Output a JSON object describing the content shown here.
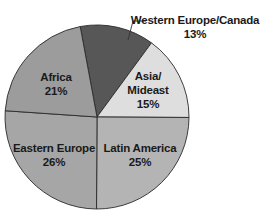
{
  "chart_data": {
    "type": "pie",
    "title": "",
    "start_angle_deg": -100.5,
    "direction": "clockwise",
    "center": [
      97,
      117
    ],
    "radius": 92,
    "slices": [
      {
        "label": "Western Europe/Canada",
        "value": 13,
        "display": "13%",
        "color": "#575757",
        "label_lines": [
          "Western Europe/Canada",
          "13%"
        ],
        "label_pos": [
          195,
          24
        ],
        "external": true,
        "leader": [
          [
            128,
            40
          ],
          [
            133,
            21
          ],
          [
            146,
            21
          ]
        ]
      },
      {
        "label": "Asia/Mideast",
        "value": 15,
        "display": "15%",
        "color": "#dedede",
        "label_lines": [
          "Asia/",
          "Mideast",
          "15%"
        ],
        "label_pos": [
          148,
          80
        ],
        "external": false
      },
      {
        "label": "Latin America",
        "value": 25,
        "display": "25%",
        "color": "#b4b4b4",
        "label_lines": [
          "Latin America",
          "25%"
        ],
        "label_pos": [
          140,
          152
        ],
        "external": false
      },
      {
        "label": "Eastern Europe",
        "value": 26,
        "display": "26%",
        "color": "#a6a6a6",
        "label_lines": [
          "Eastern Europe",
          "26%"
        ],
        "label_pos": [
          54,
          152
        ],
        "external": false
      },
      {
        "label": "Africa",
        "value": 21,
        "display": "21%",
        "color": "#9c9c9c",
        "label_lines": [
          "Africa",
          "21%"
        ],
        "label_pos": [
          56,
          81
        ],
        "external": false
      }
    ],
    "categories": [
      "Western Europe/Canada",
      "Asia/Mideast",
      "Latin America",
      "Eastern Europe",
      "Africa"
    ],
    "values": [
      13,
      15,
      25,
      26,
      21
    ],
    "legend": "none (direct labels)"
  }
}
